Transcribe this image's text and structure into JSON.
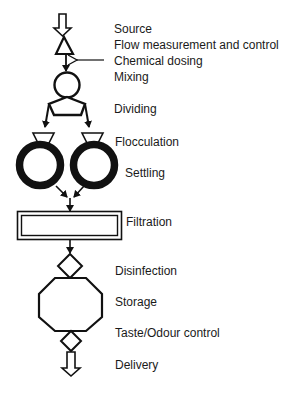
{
  "diagram": {
    "stages": [
      {
        "id": "source",
        "label": "Source"
      },
      {
        "id": "flow",
        "label": "Flow measurement and control"
      },
      {
        "id": "chemical",
        "label": "Chemical dosing"
      },
      {
        "id": "mixing",
        "label": "Mixing"
      },
      {
        "id": "dividing",
        "label": "Dividing"
      },
      {
        "id": "flocculation",
        "label": "Flocculation"
      },
      {
        "id": "settling",
        "label": "Settling"
      },
      {
        "id": "filtration",
        "label": "Filtration"
      },
      {
        "id": "disinfection",
        "label": "Disinfection"
      },
      {
        "id": "storage",
        "label": "Storage"
      },
      {
        "id": "taste",
        "label": "Taste/Odour control"
      },
      {
        "id": "delivery",
        "label": "Delivery"
      }
    ],
    "icons": {
      "source": "hollow-down-arrow-icon",
      "flow": "triangle-icon",
      "chemical": "left-arrow-icon",
      "mixing": "circle-icon",
      "dividing": "pentagon-icon",
      "flocculation": "trapezoid-icon",
      "settling": "thick-ring-icon",
      "filtration": "double-border-rectangle-icon",
      "disinfection": "diamond-icon",
      "storage": "octagon-icon",
      "taste": "diamond-icon",
      "delivery": "hollow-down-arrow-icon"
    },
    "colors": {
      "stroke": "#111111",
      "background": "#ffffff"
    }
  }
}
